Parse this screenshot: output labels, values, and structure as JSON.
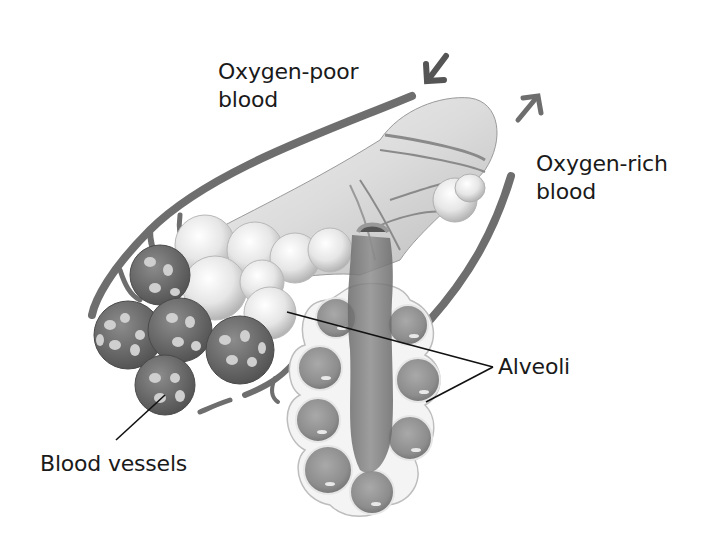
{
  "diagram": {
    "labels": {
      "oxygen_poor": "Oxygen-poor\nblood",
      "oxygen_rich": "Oxygen-rich\nblood",
      "alveoli": "Alveoli",
      "blood_vessels": "Blood vessels"
    },
    "arrows": [
      {
        "name": "oxygen-poor-inflow",
        "direction": "down-left"
      },
      {
        "name": "oxygen-rich-outflow",
        "direction": "up-right"
      }
    ],
    "colors": {
      "background": "#ffffff",
      "text": "#1a1a1a",
      "vessel": "#6e6e6e",
      "vessel_dark": "#555555",
      "alveolus_light": "#eeeeee",
      "alveolus_mid": "#cfcfcf",
      "cross_section": "#8a8a8a",
      "leader_line": "#111111"
    }
  }
}
